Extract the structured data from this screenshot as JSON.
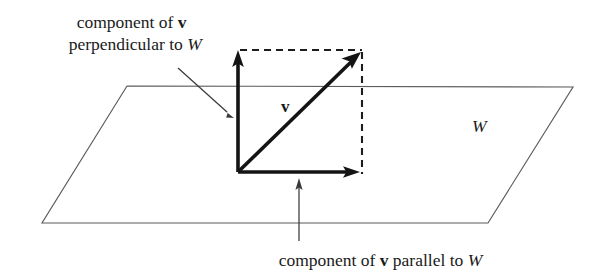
{
  "figure": {
    "kind": "vector-decomposition-diagram",
    "background_color": "#ffffff",
    "ink_color": "#141414",
    "plane_stroke_color": "#5b5b5b",
    "width": 600,
    "height": 276
  },
  "annotations": {
    "top_label": {
      "line1_prefix": "component of ",
      "line1_vector": "v",
      "line2_prefix": "perpendicular to ",
      "line2_subspace": "W"
    },
    "bottom_label": {
      "prefix": "component of ",
      "vector": "v",
      "middle": " parallel to ",
      "subspace": "W"
    },
    "plane_label": "W",
    "vector_label": "v"
  },
  "geometry": {
    "plane": {
      "top_left": [
        127,
        86
      ],
      "top_right": [
        573,
        87
      ],
      "bottom_right": [
        488,
        223
      ],
      "bottom_left": [
        42,
        223
      ]
    },
    "origin": [
      238,
      172
    ],
    "perpendicular_tip": [
      238,
      52
    ],
    "parallel_tip": [
      358,
      172
    ],
    "resultant_tip": [
      360,
      53
    ],
    "dashed_top": [
      [
        240,
        50
      ],
      [
        362,
        50
      ]
    ],
    "dashed_right": [
      [
        362,
        52
      ],
      [
        362,
        174
      ]
    ],
    "top_leader": [
      [
        178,
        68
      ],
      [
        233,
        118
      ]
    ],
    "bottom_leader": [
      [
        299,
        241
      ],
      [
        299,
        180
      ]
    ]
  },
  "colors": {
    "ink": "#141414",
    "plane": "#5b5b5b",
    "leader": "#3a3a3a",
    "text": "#1a1a1a"
  }
}
